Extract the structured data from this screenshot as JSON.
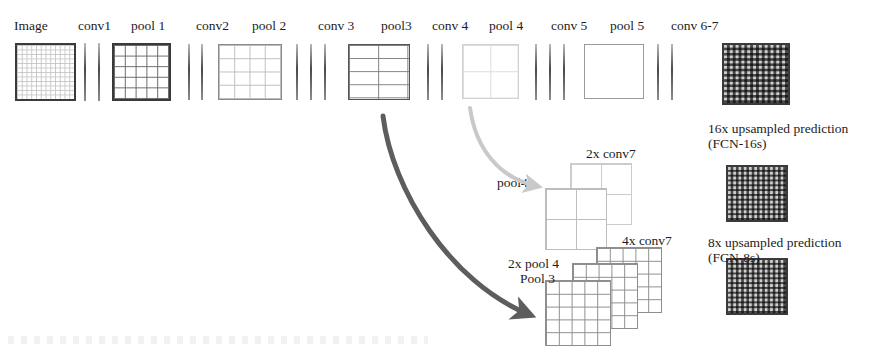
{
  "diagram": {
    "pipeline_labels": [
      {
        "id": "image",
        "text": "Image",
        "x": 14,
        "y": 18
      },
      {
        "id": "conv1",
        "text": "conv1",
        "x": 78,
        "y": 18
      },
      {
        "id": "pool1",
        "text": "pool 1",
        "x": 131,
        "y": 18
      },
      {
        "id": "conv2",
        "text": "conv2",
        "x": 196,
        "y": 18
      },
      {
        "id": "pool2",
        "text": "pool 2",
        "x": 252,
        "y": 18
      },
      {
        "id": "conv3",
        "text": "conv 3",
        "x": 318,
        "y": 18
      },
      {
        "id": "pool3",
        "text": "pool3",
        "x": 381,
        "y": 18
      },
      {
        "id": "conv4",
        "text": "conv 4",
        "x": 432,
        "y": 18
      },
      {
        "id": "pool4",
        "text": "pool 4",
        "x": 489,
        "y": 18
      },
      {
        "id": "conv5",
        "text": "conv 5",
        "x": 551,
        "y": 18
      },
      {
        "id": "pool5",
        "text": "pool 5",
        "x": 610,
        "y": 18
      },
      {
        "id": "conv67",
        "text": "conv 6-7",
        "x": 671,
        "y": 18
      }
    ],
    "feature_maps": [
      {
        "id": "image-map",
        "name": "image-feature-map",
        "x": 15,
        "y": 43,
        "w": 61,
        "h": 58,
        "cols": 12,
        "rows": 12,
        "border": "#3b3b3b",
        "bw": 2,
        "line": "#c8c8c8"
      },
      {
        "id": "pool1-map",
        "name": "pool1-feature-map",
        "x": 112,
        "y": 43,
        "w": 59,
        "h": 58,
        "cols": 5,
        "rows": 5,
        "border": "#3a3a3a",
        "bw": 2.5,
        "line": "#6a6a6a"
      },
      {
        "id": "pool2-map",
        "name": "pool2-feature-map",
        "x": 218,
        "y": 44,
        "w": 64,
        "h": 56,
        "cols": 4,
        "rows": 4,
        "border": "#8a8a8a",
        "bw": 1.5,
        "line": "#bdbdbd"
      },
      {
        "id": "pool3-map",
        "name": "pool3-feature-map",
        "x": 348,
        "y": 44,
        "w": 62,
        "h": 56,
        "cols": 2,
        "rows": 4,
        "border": "#555555",
        "bw": 1.8,
        "line": "#7e7e7e"
      },
      {
        "id": "pool4-map",
        "name": "pool4-feature-map",
        "x": 462,
        "y": 44,
        "w": 57,
        "h": 55,
        "cols": 2,
        "rows": 2,
        "border": "#d2d2d2",
        "bw": 1.2,
        "line": "#dcdcdc"
      },
      {
        "id": "pool5-map",
        "name": "pool5-feature-map",
        "x": 584,
        "y": 44,
        "w": 60,
        "h": 55,
        "cols": 1,
        "rows": 1,
        "border": "#9a9a9a",
        "bw": 1.5,
        "line": "#b5b5b5"
      }
    ],
    "conv_bar_groups": [
      {
        "id": "conv1-bars",
        "name": "conv1-layer-bars",
        "xs": [
          84,
          98
        ],
        "y": 43,
        "h": 58
      },
      {
        "id": "conv2-bars",
        "name": "conv2-layer-bars",
        "xs": [
          188,
          201
        ],
        "y": 44,
        "h": 56
      },
      {
        "id": "conv3-bars",
        "name": "conv3-layer-bars",
        "xs": [
          296,
          310,
          324
        ],
        "y": 44,
        "h": 56
      },
      {
        "id": "conv4-bars",
        "name": "conv4-layer-bars",
        "xs": [
          427,
          441
        ],
        "y": 44,
        "h": 56
      },
      {
        "id": "conv5-bars",
        "name": "conv5-layer-bars",
        "xs": [
          535,
          549,
          563
        ],
        "y": 44,
        "h": 56
      },
      {
        "id": "conv67-bars",
        "name": "conv6-7-layer-bars",
        "xs": [
          657,
          671
        ],
        "y": 44,
        "h": 56
      }
    ],
    "predictions": [
      {
        "id": "fcn32-map",
        "name": "prediction-grid-top",
        "x": 722,
        "y": 43,
        "w": 68,
        "h": 62,
        "cells": 11
      },
      {
        "id": "fcn16-map",
        "name": "prediction-grid-middle",
        "x": 726,
        "y": 165,
        "w": 62,
        "h": 57,
        "cells": 11
      },
      {
        "id": "fcn8-map",
        "name": "prediction-grid-bottom",
        "x": 726,
        "y": 258,
        "w": 62,
        "h": 57,
        "cells": 11
      }
    ],
    "prediction_captions": [
      {
        "id": "cap-16s",
        "line1": "16x upsampled prediction",
        "line2": "(FCN-16s)",
        "x": 708,
        "y": 121
      },
      {
        "id": "cap-8s",
        "line1": "8x upsampled prediction",
        "line2": "(FCN-8s)",
        "x": 708,
        "y": 235
      }
    ],
    "fusion_mid": {
      "name": "pool4-fusion-group",
      "label_pool4": {
        "text": "pool4",
        "x": 497,
        "y": 175
      },
      "label_2x_conv7": {
        "text": "2x conv7",
        "x": 586,
        "y": 146
      },
      "back_card": {
        "x": 570,
        "y": 163,
        "w": 62,
        "h": 62,
        "cells": 2
      },
      "front_card": {
        "x": 545,
        "y": 188,
        "w": 62,
        "h": 62,
        "cells": 2
      }
    },
    "fusion_bottom": {
      "name": "pool3-fusion-group",
      "label_4x_conv7": {
        "text": "4x conv7",
        "x": 622,
        "y": 233
      },
      "label_2x_pool4": {
        "text": "2x pool 4",
        "x": 508,
        "y": 256
      },
      "label_pool3": {
        "text": "Pool 3",
        "x": 520,
        "y": 271
      },
      "cards": [
        {
          "id": "card-4x-conv7",
          "x": 596,
          "y": 247,
          "w": 66,
          "h": 66,
          "cells": 5
        },
        {
          "id": "card-2x-pool4",
          "x": 572,
          "y": 263,
          "w": 66,
          "h": 66,
          "cells": 5
        },
        {
          "id": "card-pool3",
          "x": 545,
          "y": 280,
          "w": 66,
          "h": 66,
          "cells": 5
        }
      ]
    },
    "arrows": [
      {
        "id": "pool4-skip-arrow",
        "name": "pool4-skip-arrow",
        "color": "#c9c9c9",
        "width": 4,
        "path": "M 470 108 C 476 150, 500 178, 536 186"
      },
      {
        "id": "pool3-skip-arrow",
        "name": "pool3-skip-arrow",
        "color": "#5d5d5d",
        "width": 5,
        "path": "M 383 116 C 392 190, 450 282, 528 314"
      }
    ]
  }
}
